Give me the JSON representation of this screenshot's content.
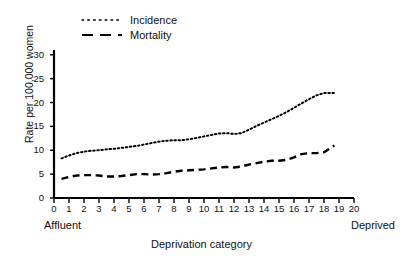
{
  "chart_data": {
    "type": "line",
    "title": "",
    "xlabel": "Deprivation category",
    "ylabel": "Rate per 100,000 women",
    "xlim": [
      0,
      20
    ],
    "ylim": [
      0,
      31
    ],
    "yticks": [
      0,
      5,
      10,
      15,
      20,
      25,
      30
    ],
    "xticks": [
      0,
      1,
      2,
      3,
      4,
      5,
      6,
      7,
      8,
      9,
      10,
      11,
      12,
      13,
      14,
      15,
      16,
      17,
      18,
      19,
      20
    ],
    "grid": false,
    "legend_position": "top-left",
    "x_axis_endpoint_labels": {
      "left": "Affluent",
      "right": "Deprived"
    },
    "x": [
      0.5,
      1,
      1.5,
      2,
      2.5,
      3,
      3.5,
      4,
      4.5,
      5,
      5.5,
      6,
      6.5,
      7,
      7.5,
      8,
      8.5,
      9,
      9.5,
      10,
      10.5,
      11,
      11.5,
      12,
      12.5,
      13,
      13.5,
      14,
      14.5,
      15,
      15.5,
      16,
      16.5,
      17,
      17.5,
      18,
      18.7
    ],
    "series": [
      {
        "name": "Incidence",
        "style": "dotted",
        "color": "#000000",
        "values": [
          8.3,
          8.9,
          9.4,
          9.7,
          9.9,
          10.0,
          10.2,
          10.3,
          10.5,
          10.7,
          10.9,
          11.2,
          11.5,
          11.8,
          12.0,
          12.1,
          12.1,
          12.3,
          12.6,
          12.9,
          13.2,
          13.5,
          13.6,
          13.4,
          13.6,
          14.3,
          15.1,
          15.8,
          16.5,
          17.2,
          18.0,
          18.9,
          19.8,
          20.7,
          21.5,
          22.0,
          22.0
        ]
      },
      {
        "name": "Mortality",
        "style": "dashed",
        "color": "#000000",
        "values": [
          4.0,
          4.4,
          4.7,
          4.8,
          4.8,
          4.7,
          4.5,
          4.5,
          4.6,
          4.8,
          5.0,
          5.0,
          4.9,
          5.0,
          5.2,
          5.5,
          5.7,
          5.8,
          5.9,
          6.0,
          6.2,
          6.4,
          6.5,
          6.4,
          6.6,
          7.0,
          7.3,
          7.6,
          7.8,
          7.8,
          8.0,
          8.5,
          9.2,
          9.4,
          9.4,
          9.6,
          11.0
        ]
      }
    ]
  },
  "legend": {
    "entries": [
      {
        "label": "Incidence",
        "style": "dotted"
      },
      {
        "label": "Mortality",
        "style": "dashed"
      }
    ]
  }
}
